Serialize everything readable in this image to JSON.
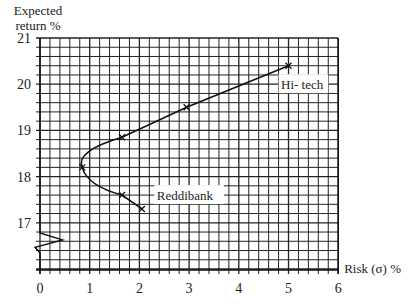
{
  "chart_data": {
    "type": "line",
    "title": "",
    "xlabel": "Risk (σ) %",
    "ylabel_line1": "Expected",
    "ylabel_line2": "return %",
    "xlim": [
      0,
      6
    ],
    "ylim": [
      16.3,
      21
    ],
    "y_axis_break": true,
    "grid": true,
    "x_ticks": [
      "0",
      "1",
      "2",
      "3",
      "4",
      "5",
      "6"
    ],
    "y_ticks": [
      "17",
      "18",
      "19",
      "20",
      "21"
    ],
    "series": [
      {
        "name": "Portfolio frontier",
        "points": [
          {
            "x": 5.0,
            "y": 20.4
          },
          {
            "x": 2.95,
            "y": 19.5
          },
          {
            "x": 1.65,
            "y": 18.85
          },
          {
            "x": 0.85,
            "y": 18.2
          },
          {
            "x": 1.65,
            "y": 17.6
          },
          {
            "x": 2.05,
            "y": 17.3
          }
        ]
      }
    ],
    "annotations": [
      {
        "text": "Hi- tech",
        "x": 5.0,
        "y": 20.4
      },
      {
        "text": "Reddibank",
        "x": 2.05,
        "y": 17.3
      }
    ]
  }
}
